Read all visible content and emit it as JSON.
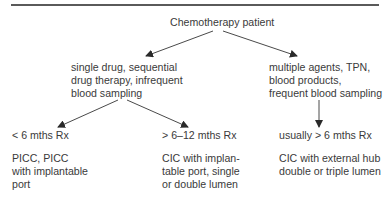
{
  "diagram": {
    "root": "Chemotherapy patient",
    "branches": [
      {
        "condition": "single drug, sequential\ndrug therapy, infrequent\nblood sampling",
        "leaves": [
          {
            "duration": "< 6 mths Rx",
            "device": "PICC, PICC\nwith implantable\nport"
          },
          {
            "duration": "> 6–12 mths Rx",
            "device": "CIC with implan-\ntable port, single\nor double lumen"
          }
        ]
      },
      {
        "condition": "multiple agents, TPN,\nblood products,\nfrequent blood sampling",
        "leaves": [
          {
            "duration": "usually > 6 mths Rx",
            "device": "CIC with external hub\ndouble or triple lumen"
          }
        ]
      }
    ],
    "colors": {
      "text": "#3a3a3a",
      "lines": "#4a4a4a",
      "rule": "#5a5a5a"
    }
  }
}
